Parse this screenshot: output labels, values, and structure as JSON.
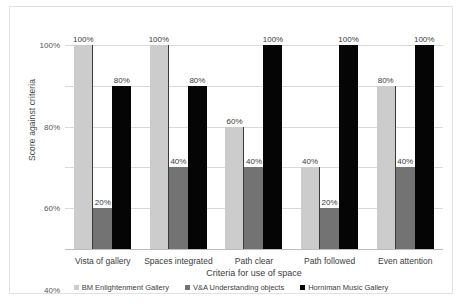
{
  "chart_data": {
    "type": "bar",
    "title": "",
    "xlabel": "Criteria for use of space",
    "ylabel": "Score against criteria",
    "ylim": [
      0,
      100
    ],
    "ytick_labels": [
      "0%",
      "20%",
      "40%",
      "60%",
      "80%",
      "100%"
    ],
    "ytick_values": [
      0,
      20,
      40,
      60,
      80,
      100
    ],
    "grid": true,
    "legend_position": "bottom",
    "categories": [
      "Vista of gallery",
      "Spaces integrated",
      "Path clear",
      "Path followed",
      "Even attention"
    ],
    "series": [
      {
        "name": "BM Enlightenment Gallery",
        "color": "#cccccc",
        "values": [
          100,
          100,
          60,
          40,
          80
        ],
        "labels": [
          "100%",
          "100%",
          "60%",
          "40%",
          "80%"
        ]
      },
      {
        "name": "V&A Understanding objects",
        "color": "#737373",
        "values": [
          20,
          40,
          40,
          20,
          40
        ],
        "labels": [
          "20%",
          "40%",
          "40%",
          "20%",
          "40%"
        ]
      },
      {
        "name": "Horniman Music Gallery",
        "color": "#050505",
        "values": [
          80,
          80,
          100,
          100,
          100
        ],
        "labels": [
          "80%",
          "80%",
          "100%",
          "100%",
          "100%"
        ]
      }
    ]
  }
}
